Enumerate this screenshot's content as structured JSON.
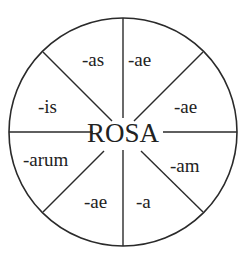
{
  "diagram": {
    "center_word": "ROSA",
    "colors": {
      "line": "#2a2a2a",
      "text": "#222222",
      "background": "#ffffff"
    },
    "segments": [
      {
        "position": "top-right",
        "ending": "-ae"
      },
      {
        "position": "right-upper",
        "ending": "-ae"
      },
      {
        "position": "right-lower",
        "ending": "-am"
      },
      {
        "position": "bottom-right",
        "ending": "-a"
      },
      {
        "position": "bottom-left",
        "ending": "-ae"
      },
      {
        "position": "left-lower",
        "ending": "-arum"
      },
      {
        "position": "left-upper",
        "ending": "-is"
      },
      {
        "position": "top-left",
        "ending": "-as"
      }
    ]
  }
}
